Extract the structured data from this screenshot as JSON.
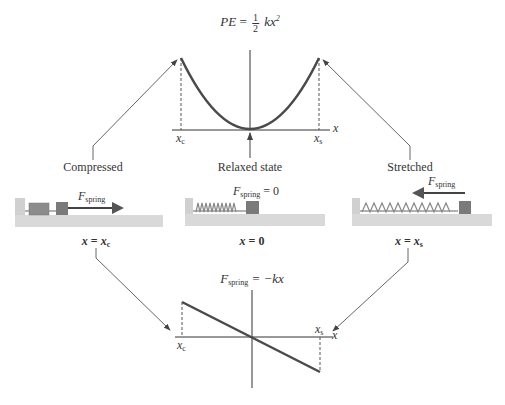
{
  "top_graph": {
    "equation": {
      "lhs": "PE",
      "eq": "=",
      "frac_num": "1",
      "frac_den": "2",
      "rhs": "kx",
      "exp": "2"
    },
    "axis_label": "x",
    "tick_left": {
      "main": "x",
      "sub": "c"
    },
    "tick_right": {
      "main": "x",
      "sub": "s"
    }
  },
  "states": [
    {
      "label": "Compressed",
      "force_label": {
        "main": "F",
        "sub": "spring"
      },
      "position": {
        "lhs": "x",
        "eq": "=",
        "main": "x",
        "sub": "c"
      }
    },
    {
      "label": "Relaxed state",
      "force_label": {
        "main": "F",
        "sub": "spring",
        "rest": "= 0"
      },
      "position": {
        "lhs": "x",
        "eq": "=",
        "main": "0"
      }
    },
    {
      "label": "Stretched",
      "force_label": {
        "main": "F",
        "sub": "spring"
      },
      "position": {
        "lhs": "x",
        "eq": "=",
        "main": "x",
        "sub": "s"
      }
    }
  ],
  "bottom_graph": {
    "equation": {
      "main": "F",
      "sub": "spring",
      "rest": "= −kx"
    },
    "axis_label": "x",
    "tick_left": {
      "main": "x",
      "sub": "c"
    },
    "tick_right": {
      "main": "x",
      "sub": "s"
    }
  },
  "colors": {
    "curve": "#4a4a4a",
    "mass": "#7a7a7a",
    "spring": "#8c8c8c",
    "floor": "#d9d9d9",
    "arrow": "#555555"
  }
}
